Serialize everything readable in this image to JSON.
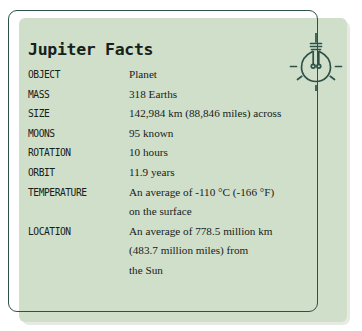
{
  "card": {
    "title": "Jupiter Facts",
    "background_color": "#cfdfca",
    "border_color": "#2f5148",
    "text_color": "#17211b"
  },
  "icon": {
    "name": "lightbulb-icon",
    "color": "#2f5148"
  },
  "facts": [
    {
      "label": "OBJECT",
      "lines": [
        "Planet"
      ]
    },
    {
      "label": "MASS",
      "lines": [
        "318 Earths"
      ]
    },
    {
      "label": "SIZE",
      "lines": [
        "142,984 km (88,846 miles) across"
      ]
    },
    {
      "label": "MOONS",
      "lines": [
        "95 known"
      ]
    },
    {
      "label": "ROTATION",
      "lines": [
        "10 hours"
      ]
    },
    {
      "label": "ORBIT",
      "lines": [
        "11.9 years"
      ]
    },
    {
      "label": "TEMPERATURE",
      "lines": [
        "An average of -110 °C (-166 °F)",
        "on the surface"
      ]
    },
    {
      "label": "LOCATION",
      "lines": [
        "An average of 778.5 million km",
        "(483.7 million miles) from",
        "the Sun"
      ]
    }
  ]
}
